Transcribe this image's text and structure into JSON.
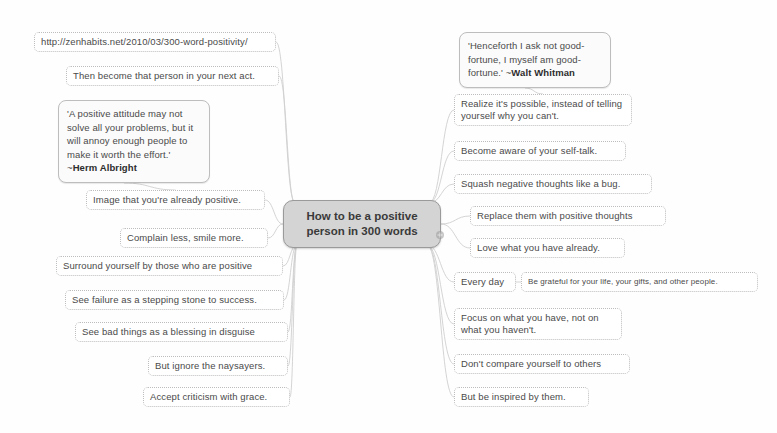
{
  "map": {
    "center": {
      "label": "How to be a positive person in 300 words",
      "x": 283,
      "y": 200,
      "w": 158,
      "h": 48,
      "fill": "#d4d4d4",
      "border": "#9a9a9a"
    },
    "marker": {
      "name": "attachment-marker-icon",
      "x": 435,
      "y": 230
    },
    "edge_color": "#cfcfcf",
    "node_border_color": "#bdbdbd",
    "text_color": "#4a4a4a",
    "background": "#fefefe",
    "nodes": [
      {
        "id": "source-url",
        "text": "http://zenhabits.net/2010/03/300-word-positivity/",
        "x": 34,
        "y": 32,
        "w": 242,
        "h": 18,
        "style": "plain",
        "anchor": "right",
        "edge_from": "top"
      },
      {
        "id": "then-become",
        "text": "Then become that person in your next act.",
        "x": 66,
        "y": 66,
        "w": 213,
        "h": 18,
        "style": "plain",
        "anchor": "right",
        "edge_from": "top"
      },
      {
        "id": "quote-albright",
        "text": "'A positive attitude may not solve all your problems, but it will annoy enough people to make it worth the effort.' ~",
        "author": "Herm Albright",
        "x": 58,
        "y": 100,
        "w": 152,
        "h": 82,
        "style": "quote",
        "anchor": "bottom",
        "edge_from": "none"
      },
      {
        "id": "image-positive",
        "text": "Image that you're already positive.",
        "x": 86,
        "y": 190,
        "w": 179,
        "h": 18,
        "style": "plain",
        "anchor": "right",
        "edge_from": "left"
      },
      {
        "id": "complain-less",
        "text": "Complain less, smile more.",
        "x": 120,
        "y": 228,
        "w": 148,
        "h": 18,
        "style": "plain",
        "anchor": "right",
        "edge_from": "left"
      },
      {
        "id": "surround-yourself",
        "text": "Surround yourself by those who are positive",
        "x": 56,
        "y": 256,
        "w": 227,
        "h": 18,
        "style": "plain",
        "anchor": "right",
        "edge_from": "bottomleft"
      },
      {
        "id": "see-failure",
        "text": "See failure as a stepping stone to success.",
        "x": 65,
        "y": 290,
        "w": 219,
        "h": 18,
        "style": "plain",
        "anchor": "right",
        "edge_from": "bottomleft"
      },
      {
        "id": "see-bad-things",
        "text": "See bad things as a blessing in disguise",
        "x": 75,
        "y": 322,
        "w": 213,
        "h": 18,
        "style": "plain",
        "anchor": "right",
        "edge_from": "bottomleft"
      },
      {
        "id": "ignore-naysayers",
        "text": "But ignore the naysayers.",
        "x": 148,
        "y": 356,
        "w": 140,
        "h": 18,
        "style": "plain",
        "anchor": "right",
        "edge_from": "bottomleft"
      },
      {
        "id": "accept-criticism",
        "text": "Accept criticism with grace.",
        "x": 143,
        "y": 387,
        "w": 147,
        "h": 18,
        "style": "plain",
        "anchor": "right",
        "edge_from": "bottomleft"
      },
      {
        "id": "quote-whitman",
        "text": "'Henceforth I ask not good-fortune, I myself am good-fortune.' ~",
        "author": "Walt Whitman",
        "x": 459,
        "y": 32,
        "w": 152,
        "h": 57,
        "style": "quote",
        "anchor": "bottom",
        "edge_from": "none"
      },
      {
        "id": "realize-possible",
        "text": "Realize it's possible, instead of telling yourself why you can't.",
        "x": 454,
        "y": 94,
        "w": 178,
        "h": 30,
        "style": "wrap",
        "anchor": "left",
        "edge_from": "top"
      },
      {
        "id": "become-aware",
        "text": "Become aware of your self-talk.",
        "x": 454,
        "y": 141,
        "w": 172,
        "h": 18,
        "style": "plain",
        "anchor": "left",
        "edge_from": "top"
      },
      {
        "id": "squash-negative",
        "text": "Squash negative thoughts like a bug.",
        "x": 454,
        "y": 174,
        "w": 198,
        "h": 18,
        "style": "plain",
        "anchor": "left",
        "edge_from": "top"
      },
      {
        "id": "replace-thoughts",
        "text": "Replace them with positive thoughts",
        "x": 470,
        "y": 206,
        "w": 196,
        "h": 18,
        "style": "plain",
        "anchor": "left",
        "edge_from": "right"
      },
      {
        "id": "love-what-you-have",
        "text": "Love what you have already.",
        "x": 470,
        "y": 238,
        "w": 155,
        "h": 18,
        "style": "plain",
        "anchor": "left",
        "edge_from": "right"
      },
      {
        "id": "every-day",
        "text": "Every day",
        "x": 454,
        "y": 272,
        "w": 62,
        "h": 18,
        "style": "plain",
        "anchor": "left",
        "edge_from": "bottomright"
      },
      {
        "id": "be-grateful",
        "text": "Be grateful for your life, your gifts, and other people.",
        "x": 521,
        "y": 272,
        "w": 237,
        "h": 18,
        "style": "small",
        "anchor": "left",
        "edge_from": "every-day"
      },
      {
        "id": "focus-on-what",
        "text": "Focus on what you have, not on what you haven't.",
        "x": 454,
        "y": 308,
        "w": 168,
        "h": 30,
        "style": "wrap",
        "anchor": "left",
        "edge_from": "bottomright"
      },
      {
        "id": "dont-compare",
        "text": "Don't compare yourself to others",
        "x": 454,
        "y": 354,
        "w": 176,
        "h": 18,
        "style": "plain",
        "anchor": "left",
        "edge_from": "bottomright"
      },
      {
        "id": "be-inspired",
        "text": "But be inspired by them.",
        "x": 454,
        "y": 387,
        "w": 135,
        "h": 18,
        "style": "plain",
        "anchor": "left",
        "edge_from": "bottomright"
      }
    ]
  }
}
